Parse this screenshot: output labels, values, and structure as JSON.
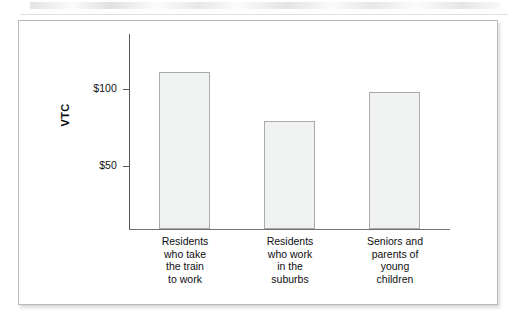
{
  "chart_data": {
    "type": "bar",
    "title": "",
    "subtitle": "",
    "xlabel": "",
    "ylabel": "VTC",
    "categories": [
      "Residents who take the train to work",
      "Residents who work in the suburbs",
      "Seniors and parents of young children"
    ],
    "category_lines": [
      [
        "Residents",
        "who take",
        "the train",
        "to work"
      ],
      [
        "Residents",
        "who work",
        "in the",
        "suburbs"
      ],
      [
        "Seniors and",
        "parents of",
        "young",
        "children"
      ]
    ],
    "values": [
      111,
      79,
      98
    ],
    "ytick_labels": [
      "$100",
      "$50"
    ],
    "ytick_values": [
      100,
      50
    ],
    "ylim": [
      0,
      130
    ],
    "grid": false,
    "legend": false,
    "bar_fill_color": "#f0f1f1",
    "bar_edge_color": "#a8aaad",
    "axis_color": "#575a5e",
    "text_color": "#0e0e10",
    "frame_border_color": "#b9b9bd",
    "background_color": "#ffffff"
  }
}
